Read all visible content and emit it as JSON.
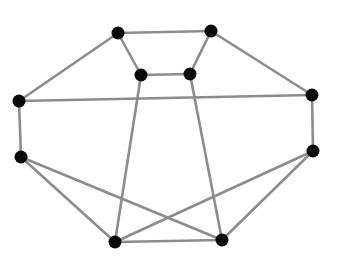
{
  "diagram": {
    "type": "graph",
    "edge_color": "#8c8c8c",
    "node_color": "#0a0a0a",
    "background": "#ffffff",
    "node_radius": 6.5,
    "nodes": [
      {
        "id": "A",
        "x": 118,
        "y": 33
      },
      {
        "id": "B",
        "x": 211,
        "y": 31
      },
      {
        "id": "C",
        "x": 141,
        "y": 75
      },
      {
        "id": "D",
        "x": 190,
        "y": 74
      },
      {
        "id": "E",
        "x": 19,
        "y": 101
      },
      {
        "id": "F",
        "x": 312,
        "y": 95
      },
      {
        "id": "G",
        "x": 21,
        "y": 157
      },
      {
        "id": "H",
        "x": 313,
        "y": 151
      },
      {
        "id": "I",
        "x": 115,
        "y": 242
      },
      {
        "id": "J",
        "x": 222,
        "y": 240
      }
    ],
    "edges": [
      [
        "A",
        "B"
      ],
      [
        "A",
        "C"
      ],
      [
        "B",
        "D"
      ],
      [
        "C",
        "D"
      ],
      [
        "A",
        "E"
      ],
      [
        "B",
        "F"
      ],
      [
        "E",
        "F"
      ],
      [
        "E",
        "G"
      ],
      [
        "F",
        "H"
      ],
      [
        "C",
        "I"
      ],
      [
        "D",
        "J"
      ],
      [
        "G",
        "I"
      ],
      [
        "G",
        "J"
      ],
      [
        "H",
        "I"
      ],
      [
        "H",
        "J"
      ],
      [
        "I",
        "J"
      ]
    ]
  }
}
